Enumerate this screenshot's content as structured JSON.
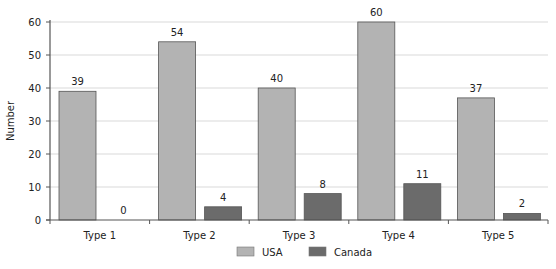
{
  "chart_data": {
    "type": "bar",
    "title": "",
    "xlabel": "",
    "ylabel": "Number",
    "ylim": [
      0,
      60
    ],
    "yticks": [
      0,
      10,
      20,
      30,
      40,
      50,
      60
    ],
    "grid": true,
    "legend_position": "bottom",
    "categories": [
      "Type 1",
      "Type 2",
      "Type 3",
      "Type 4",
      "Type 5"
    ],
    "series": [
      {
        "name": "USA",
        "values": [
          39,
          54,
          40,
          60,
          37
        ],
        "color": "#b3b3b3"
      },
      {
        "name": "Canada",
        "values": [
          0,
          4,
          8,
          11,
          2
        ],
        "color": "#6b6b6b"
      }
    ]
  }
}
